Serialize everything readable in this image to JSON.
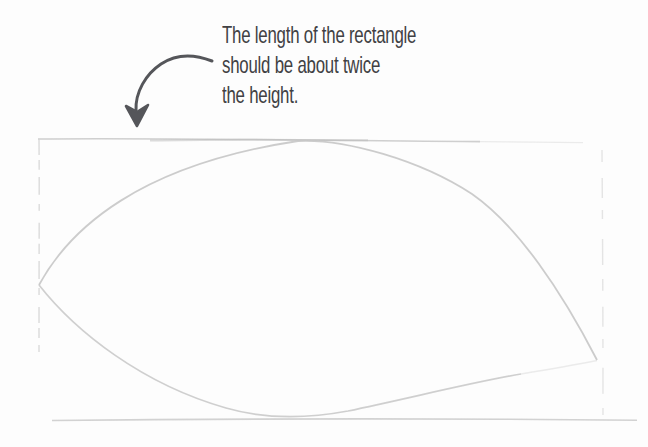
{
  "palette": {
    "page-bg": "#fdfdfd",
    "ink": "#414144",
    "arrow": "#55565a",
    "pencil-light": "#d4d4d4",
    "pencil-mid": "#c7c7c7",
    "pencil-dark": "#b9b9b9"
  },
  "annotation": {
    "lines": [
      "The length of the rectangle",
      "should be about twice",
      "the height."
    ]
  },
  "icons": {
    "arrow": "curved-arrow-pointing-down-to-rectangle"
  }
}
